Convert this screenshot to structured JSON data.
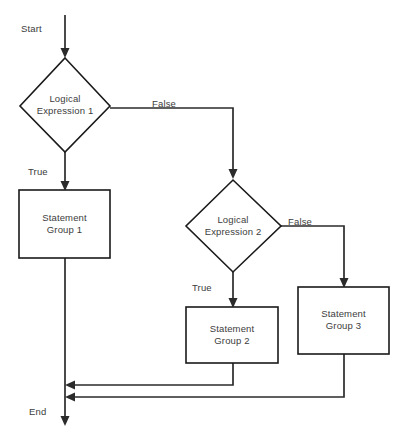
{
  "diagram": {
    "type": "flowchart",
    "canvas": {
      "width": 406,
      "height": 437,
      "background": "#ffffff"
    },
    "colors": {
      "shape_stroke": "#1a1a1a",
      "shape_fill": "#ffffff",
      "connector": "#2b2b2b",
      "text": "#3c3c3c"
    },
    "terminals": [
      {
        "id": "start",
        "label": "Start"
      },
      {
        "id": "end",
        "label": "End"
      }
    ],
    "nodes": [
      {
        "id": "decision1",
        "shape": "diamond",
        "label": "Logical\nExpression 1"
      },
      {
        "id": "process1",
        "shape": "rectangle",
        "label": "Statement\nGroup 1"
      },
      {
        "id": "decision2",
        "shape": "diamond",
        "label": "Logical\nExpression 2"
      },
      {
        "id": "process2",
        "shape": "rectangle",
        "label": "Statement\nGroup 2"
      },
      {
        "id": "process3",
        "shape": "rectangle",
        "label": "Statement\nGroup 3"
      }
    ],
    "edges": [
      {
        "id": "e-start-d1",
        "from": "start",
        "to": "decision1",
        "label": ""
      },
      {
        "id": "e-d1-false",
        "from": "decision1",
        "to": "decision2",
        "label": "False"
      },
      {
        "id": "e-d1-true",
        "from": "decision1",
        "to": "process1",
        "label": "True"
      },
      {
        "id": "e-d2-false",
        "from": "decision2",
        "to": "process3",
        "label": "False"
      },
      {
        "id": "e-d2-true",
        "from": "decision2",
        "to": "process2",
        "label": "True"
      },
      {
        "id": "e-p1-end",
        "from": "process1",
        "to": "end",
        "label": ""
      },
      {
        "id": "e-p2-merge",
        "from": "process2",
        "to": "end",
        "label": ""
      },
      {
        "id": "e-p3-merge",
        "from": "process3",
        "to": "end",
        "label": ""
      }
    ]
  }
}
